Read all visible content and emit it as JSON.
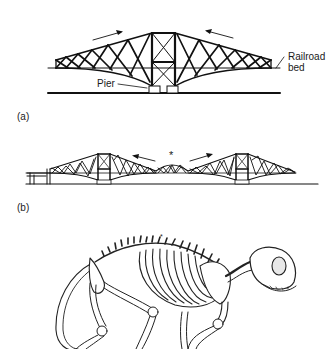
{
  "figure": {
    "panel_a": {
      "label": "(a)",
      "callouts": {
        "railroad_line1": "Railroad",
        "railroad_line2": "bed",
        "pier": "Pier"
      }
    },
    "panel_b": {
      "label": "(b)",
      "marker": "*"
    },
    "panel_c": {
      "marker": "*"
    },
    "colors": {
      "ink": "#111111",
      "background": "#ffffff"
    }
  }
}
